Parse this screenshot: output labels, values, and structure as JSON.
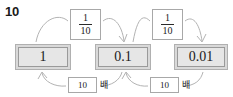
{
  "problem": {
    "number": "10"
  },
  "diagram": {
    "type": "place-value-conversion-chain",
    "values": [
      {
        "id": "one",
        "label": "1"
      },
      {
        "id": "tenth",
        "label": "0.1"
      },
      {
        "id": "hundredth",
        "label": "0.01"
      }
    ],
    "top_operations": [
      {
        "id": "frac-left",
        "numerator": "1",
        "denominator": "10",
        "from": "1",
        "to": "0.1",
        "direction": "right"
      },
      {
        "id": "frac-right",
        "numerator": "1",
        "denominator": "10",
        "from": "0.1",
        "to": "0.01",
        "direction": "right"
      }
    ],
    "bottom_operations": [
      {
        "id": "mult-left",
        "factor": "10",
        "unit": "배",
        "from": "0.1",
        "to": "1",
        "direction": "left"
      },
      {
        "id": "mult-right",
        "factor": "10",
        "unit": "배",
        "from": "0.01",
        "to": "0.1",
        "direction": "left"
      }
    ],
    "colors": {
      "box_fill": "#e6e6e6",
      "box_frame": "#d9d9d9",
      "box_border": "#9a9a9a",
      "arrow_stroke": "#b3b3b3",
      "text": "#1a1a1a",
      "background": "#ffffff"
    }
  }
}
